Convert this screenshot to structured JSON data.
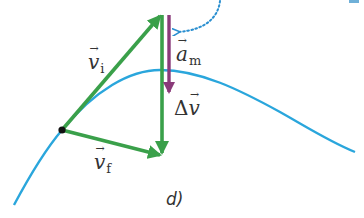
{
  "figure": {
    "caption": "d)",
    "labels": {
      "v_initial": {
        "symbol": "v",
        "subscript": "i"
      },
      "v_final": {
        "symbol": "v",
        "subscript": "f"
      },
      "a_mean": {
        "symbol": "a",
        "subscript": "m"
      },
      "delta_v": {
        "prefix": "Δ",
        "symbol": "v"
      }
    },
    "colors": {
      "vector_green": "#3aa04a",
      "acceleration_purple": "#8a3a7a",
      "trajectory_blue": "#2aa6dc",
      "dotted_arrow_blue": "#2a8fd0",
      "point_black": "#111111",
      "text": "#333333"
    }
  }
}
